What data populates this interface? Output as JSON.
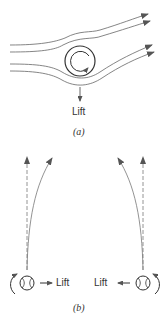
{
  "figure_a": {
    "lift_label": "Lift",
    "caption": "(a)",
    "stroke_color": "#555555"
  },
  "figure_b": {
    "left_ball": {
      "lift_label": "Lift",
      "spin": "counterclockwise",
      "lift_direction": "right"
    },
    "right_ball": {
      "lift_label": "Lift",
      "spin": "clockwise",
      "lift_direction": "left"
    },
    "caption": "(b)",
    "dashed_color": "#888888",
    "curve_color": "#666666"
  }
}
